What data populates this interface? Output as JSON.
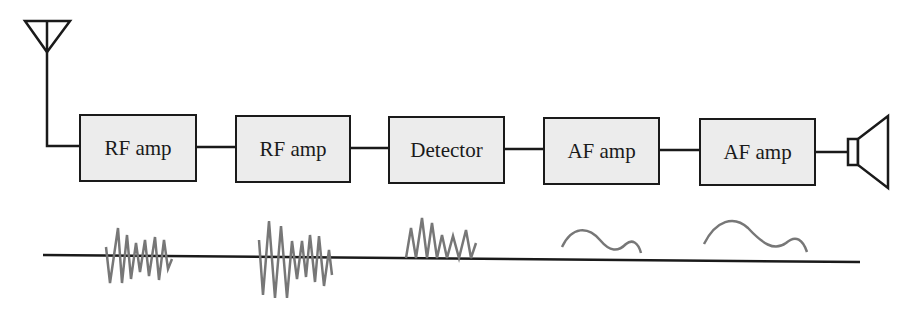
{
  "diagram": {
    "colors": {
      "line": "#1a1a1a",
      "box_fill": "#ececec",
      "waveform": "#777777"
    },
    "input": {
      "icon": "antenna-icon"
    },
    "output": {
      "icon": "speaker-icon"
    },
    "stages": [
      {
        "label": "RF amp",
        "x": 79,
        "y": 114,
        "w": 118,
        "h": 68
      },
      {
        "label": "RF amp",
        "x": 235,
        "y": 115,
        "w": 116,
        "h": 68
      },
      {
        "label": "Detector",
        "x": 388,
        "y": 116,
        "w": 117,
        "h": 68
      },
      {
        "label": "AF amp",
        "x": 543,
        "y": 117,
        "w": 117,
        "h": 68
      },
      {
        "label": "AF amp",
        "x": 699,
        "y": 118,
        "w": 117,
        "h": 68
      }
    ],
    "waveforms": [
      {
        "stage": 1,
        "type": "modulated-rf-small"
      },
      {
        "stage": 2,
        "type": "modulated-rf-large"
      },
      {
        "stage": 3,
        "type": "rectified-rf"
      },
      {
        "stage": 4,
        "type": "audio-small"
      },
      {
        "stage": 5,
        "type": "audio-large"
      }
    ]
  }
}
